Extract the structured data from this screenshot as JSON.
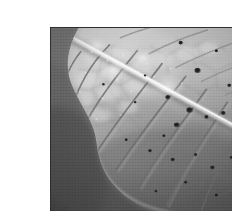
{
  "image": {
    "kind": "photograph",
    "subject": "leaf-underside-macro",
    "caption": "Grayscale macro photograph of the underside of a leaf showing the pale midrib, reticulate secondary and tertiary vein network, and scattered dark necrotic spots",
    "color_mode": "grayscale",
    "frame": {
      "margin_color": "#ffffff",
      "border_color": "#2f2f2f",
      "border_width_px": 1,
      "photo_left_px": 10,
      "photo_top_px": 11,
      "photo_width_px": 212,
      "photo_height_px": 188
    },
    "palette": {
      "background_dark": "#5a5a5a",
      "background_mid": "#6e6e6e",
      "leaf_shadow": "#7c7c7c",
      "leaf_mid": "#a0a0a0",
      "leaf_light": "#bdbdbd",
      "leaf_highlight": "#dcdcdc",
      "midrib": "#ececec",
      "vein_line": "#727272",
      "spot_dark": "#2b2723"
    },
    "regions": [
      {
        "name": "background",
        "description": "Smooth out-of-focus dark gray backdrop occupying the left edge and lower-left corner",
        "tone": "dark"
      },
      {
        "name": "leaf-blade-upper",
        "description": "Brightly lit upper portion of the leaf blade above the midrib",
        "tone": "light"
      },
      {
        "name": "midrib",
        "description": "Pale raised central vein running diagonally from upper-left toward lower-right",
        "tone": "highlight"
      },
      {
        "name": "leaf-blade-lower",
        "description": "Shadowed lower portion of the leaf blade below the midrib with a rounded lobe at the bottom",
        "tone": "mid-dark"
      },
      {
        "name": "vein-network",
        "description": "Polygonal reticulate network of secondary and tertiary veins enclosing bright areolae",
        "tone": "line"
      },
      {
        "name": "necrotic-spots",
        "description": "Scattered small dark brown-black blemishes across the blade",
        "tone": "darkest"
      }
    ],
    "midrib_path": {
      "start_pct": [
        8,
        6
      ],
      "end_pct": [
        99,
        60
      ],
      "width_pct": 2.2
    },
    "secondary_veins": [
      {
        "start_pct": [
          14,
          13
        ],
        "end_pct": [
          4,
          40
        ]
      },
      {
        "start_pct": [
          28,
          9
        ],
        "end_pct": [
          9,
          47
        ]
      },
      {
        "start_pct": [
          41,
          12
        ],
        "end_pct": [
          14,
          56
        ]
      },
      {
        "start_pct": [
          53,
          19
        ],
        "end_pct": [
          22,
          66
        ]
      },
      {
        "start_pct": [
          64,
          26
        ],
        "end_pct": [
          31,
          76
        ]
      },
      {
        "start_pct": [
          74,
          33
        ],
        "end_pct": [
          42,
          86
        ]
      },
      {
        "start_pct": [
          84,
          40
        ],
        "end_pct": [
          55,
          95
        ]
      },
      {
        "start_pct": [
          92,
          48
        ],
        "end_pct": [
          69,
          100
        ]
      },
      {
        "start_pct": [
          33,
          5
        ],
        "end_pct": [
          56,
          2
        ]
      },
      {
        "start_pct": [
          55,
          14
        ],
        "end_pct": [
          78,
          7
        ]
      },
      {
        "start_pct": [
          70,
          24
        ],
        "end_pct": [
          95,
          17
        ]
      },
      {
        "start_pct": [
          83,
          36
        ],
        "end_pct": [
          100,
          31
        ]
      }
    ],
    "spots": [
      {
        "x_pct": 62,
        "y_pct": 8,
        "r_px": 2.0
      },
      {
        "x_pct": 79,
        "y_pct": 12,
        "r_px": 1.6
      },
      {
        "x_pct": 88,
        "y_pct": 20,
        "r_px": 2.4
      },
      {
        "x_pct": 95,
        "y_pct": 17,
        "r_px": 1.4
      },
      {
        "x_pct": 70,
        "y_pct": 23,
        "r_px": 2.8
      },
      {
        "x_pct": 85,
        "y_pct": 31,
        "r_px": 1.8
      },
      {
        "x_pct": 93,
        "y_pct": 37,
        "r_px": 1.5
      },
      {
        "x_pct": 66,
        "y_pct": 44,
        "r_px": 3.0
      },
      {
        "x_pct": 74,
        "y_pct": 48,
        "r_px": 2.0
      },
      {
        "x_pct": 60,
        "y_pct": 52,
        "r_px": 2.6
      },
      {
        "x_pct": 82,
        "y_pct": 46,
        "r_px": 2.2
      },
      {
        "x_pct": 88,
        "y_pct": 55,
        "r_px": 1.6
      },
      {
        "x_pct": 54,
        "y_pct": 58,
        "r_px": 1.5
      },
      {
        "x_pct": 47,
        "y_pct": 66,
        "r_px": 1.8
      },
      {
        "x_pct": 58,
        "y_pct": 71,
        "r_px": 2.0
      },
      {
        "x_pct": 69,
        "y_pct": 68,
        "r_px": 1.6
      },
      {
        "x_pct": 77,
        "y_pct": 75,
        "r_px": 2.2
      },
      {
        "x_pct": 86,
        "y_pct": 70,
        "r_px": 1.5
      },
      {
        "x_pct": 92,
        "y_pct": 80,
        "r_px": 1.8
      },
      {
        "x_pct": 64,
        "y_pct": 83,
        "r_px": 1.6
      },
      {
        "x_pct": 50,
        "y_pct": 88,
        "r_px": 1.4
      },
      {
        "x_pct": 36,
        "y_pct": 60,
        "r_px": 1.5
      },
      {
        "x_pct": 25,
        "y_pct": 30,
        "r_px": 1.3
      },
      {
        "x_pct": 17,
        "y_pct": 73,
        "r_px": 1.4
      },
      {
        "x_pct": 40,
        "y_pct": 40,
        "r_px": 1.2
      },
      {
        "x_pct": 79,
        "y_pct": 90,
        "r_px": 1.7
      },
      {
        "x_pct": 95,
        "y_pct": 65,
        "r_px": 1.4
      }
    ],
    "highlights": [
      {
        "x_pct": 56,
        "y_pct": 32,
        "r_px": 9
      },
      {
        "x_pct": 30,
        "y_pct": 22,
        "r_px": 7
      },
      {
        "x_pct": 44,
        "y_pct": 16,
        "r_px": 6
      }
    ]
  }
}
